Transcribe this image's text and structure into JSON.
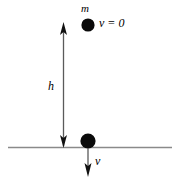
{
  "figure": {
    "type": "physics-diagram",
    "width": 177,
    "height": 181,
    "background_color": "#ffffff",
    "ink_color": "#000000",
    "ground_color": "#808080"
  },
  "labels": {
    "mass": "m",
    "initial_velocity": "v = 0",
    "height": "h",
    "final_velocity": "v"
  },
  "objects": {
    "top_ball": {
      "name": "mass-at-rest",
      "cx": 88,
      "cy": 25,
      "r": 6.5,
      "fill": "#000000"
    },
    "bottom_ball": {
      "name": "mass-at-ground",
      "cx": 88,
      "cy": 141,
      "r": 7.5,
      "fill": "#000000"
    },
    "ground_line": {
      "name": "ground-surface",
      "x1": 8,
      "y1": 147.5,
      "x2": 172,
      "y2": 147.5,
      "stroke": "#8a8a8a",
      "stroke_width": 1.6
    },
    "height_arrow": {
      "name": "height-dimension-arrow",
      "x": 63,
      "y_top": 26,
      "y_bottom": 147,
      "stroke": "#555555",
      "stroke_width": 1.2,
      "double_headed": true
    },
    "velocity_arrow": {
      "name": "impact-velocity-arrow",
      "x": 88,
      "y_top": 149,
      "y_bottom": 176,
      "stroke": "#555555",
      "stroke_width": 1.2,
      "double_headed": false
    }
  }
}
